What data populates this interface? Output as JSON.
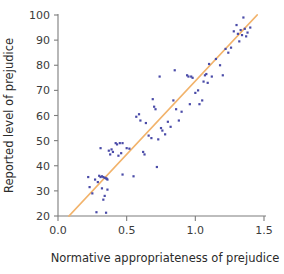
{
  "chart_data": {
    "type": "scatter",
    "title": "",
    "xlabel": "Normative appropriateness of prejudice",
    "ylabel": "Reported level of prejudice",
    "xlim": [
      0.0,
      1.5
    ],
    "ylim": [
      20,
      100
    ],
    "xticks": [
      "0.0",
      "0.5",
      "1.0",
      "1.5"
    ],
    "xtick_values": [
      0.0,
      0.5,
      1.0,
      1.5
    ],
    "yticks": [
      "20",
      "30",
      "40",
      "50",
      "60",
      "70",
      "80",
      "90",
      "100"
    ],
    "ytick_values": [
      20,
      30,
      40,
      50,
      60,
      70,
      80,
      90,
      100
    ],
    "grid": false,
    "legend": "none",
    "marker_color": "#4a4ba8",
    "line_color": "#f2b36b",
    "axis_color": "#7d7d7d",
    "series": [
      {
        "name": "observations",
        "type": "scatter",
        "points": [
          [
            0.22,
            35.5
          ],
          [
            0.23,
            31.5
          ],
          [
            0.25,
            29.0
          ],
          [
            0.27,
            34.5
          ],
          [
            0.28,
            21.5
          ],
          [
            0.29,
            33.5
          ],
          [
            0.3,
            36.0
          ],
          [
            0.31,
            35.5
          ],
          [
            0.31,
            47.0
          ],
          [
            0.32,
            31.0
          ],
          [
            0.32,
            35.8
          ],
          [
            0.33,
            35.5
          ],
          [
            0.33,
            26.5
          ],
          [
            0.34,
            35.2
          ],
          [
            0.34,
            28.0
          ],
          [
            0.35,
            35.0
          ],
          [
            0.35,
            21.3
          ],
          [
            0.355,
            34.8
          ],
          [
            0.36,
            34.5
          ],
          [
            0.36,
            30.5
          ],
          [
            0.37,
            46.0
          ],
          [
            0.38,
            44.5
          ],
          [
            0.39,
            46.5
          ],
          [
            0.4,
            45.5
          ],
          [
            0.42,
            49.0
          ],
          [
            0.43,
            48.5
          ],
          [
            0.44,
            44.0
          ],
          [
            0.45,
            49.0
          ],
          [
            0.46,
            45.0
          ],
          [
            0.47,
            49.0
          ],
          [
            0.47,
            36.5
          ],
          [
            0.5,
            47.0
          ],
          [
            0.52,
            46.8
          ],
          [
            0.55,
            35.8
          ],
          [
            0.57,
            59.5
          ],
          [
            0.59,
            60.5
          ],
          [
            0.6,
            58.0
          ],
          [
            0.62,
            45.5
          ],
          [
            0.63,
            44.5
          ],
          [
            0.64,
            57.0
          ],
          [
            0.66,
            52.0
          ],
          [
            0.68,
            51.0
          ],
          [
            0.69,
            66.5
          ],
          [
            0.7,
            63.5
          ],
          [
            0.71,
            62.5
          ],
          [
            0.72,
            39.5
          ],
          [
            0.73,
            50.5
          ],
          [
            0.74,
            75.5
          ],
          [
            0.75,
            55.0
          ],
          [
            0.76,
            54.0
          ],
          [
            0.78,
            52.5
          ],
          [
            0.8,
            57.5
          ],
          [
            0.82,
            55.5
          ],
          [
            0.84,
            66.0
          ],
          [
            0.85,
            78.0
          ],
          [
            0.86,
            62.5
          ],
          [
            0.88,
            58.0
          ],
          [
            0.9,
            61.5
          ],
          [
            0.94,
            76.0
          ],
          [
            0.95,
            75.5
          ],
          [
            0.96,
            64.5
          ],
          [
            0.97,
            75.5
          ],
          [
            0.98,
            75.0
          ],
          [
            1.0,
            69.0
          ],
          [
            1.02,
            70.0
          ],
          [
            1.03,
            64.5
          ],
          [
            1.05,
            66.0
          ],
          [
            1.06,
            73.5
          ],
          [
            1.07,
            76.0
          ],
          [
            1.08,
            76.5
          ],
          [
            1.09,
            73.0
          ],
          [
            1.1,
            80.5
          ],
          [
            1.12,
            75.5
          ],
          [
            1.15,
            82.5
          ],
          [
            1.18,
            80.0
          ],
          [
            1.2,
            76.0
          ],
          [
            1.22,
            86.5
          ],
          [
            1.24,
            85.0
          ],
          [
            1.26,
            87.0
          ],
          [
            1.28,
            93.5
          ],
          [
            1.3,
            96.0
          ],
          [
            1.31,
            92.5
          ],
          [
            1.32,
            89.5
          ],
          [
            1.33,
            94.0
          ],
          [
            1.34,
            92.0
          ],
          [
            1.35,
            99.0
          ],
          [
            1.36,
            94.5
          ],
          [
            1.37,
            91.5
          ],
          [
            1.38,
            93.0
          ],
          [
            1.4,
            95.0
          ]
        ]
      },
      {
        "name": "regression-line",
        "type": "line",
        "x": [
          0.08,
          1.45
        ],
        "y": [
          20.0,
          100.0
        ]
      }
    ]
  }
}
